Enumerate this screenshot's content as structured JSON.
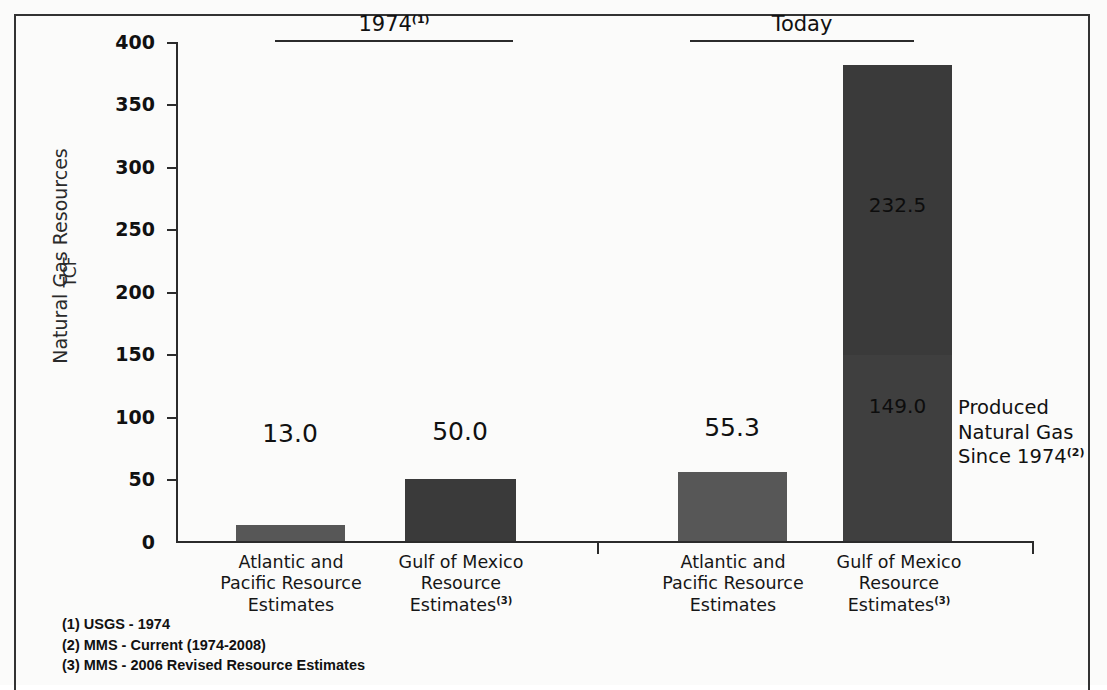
{
  "chart_data": {
    "type": "bar",
    "title": "",
    "subtitle": "",
    "xlabel": "",
    "ylabel": "Natural Gas Resources",
    "ylabel_unit": "TCF",
    "ylim": [
      0,
      400
    ],
    "ytick_step": 50,
    "yticks": [
      "400",
      "350",
      "300",
      "250",
      "200",
      "150",
      "100",
      "50",
      "0"
    ],
    "grid": false,
    "legend_position": "none",
    "stacked": true,
    "group_headers": [
      {
        "label": "1974",
        "footnote_marker": "(1)"
      },
      {
        "label": "Today",
        "footnote_marker": "(2)"
      }
    ],
    "categories": [
      "Atlantic and Pacific Resource Estimates",
      "Gulf of Mexico Resource Estimates",
      "Atlantic and Pacific Resource Estimates",
      "Gulf of Mexico Resource Estimates"
    ],
    "bars": [
      {
        "group": "1974",
        "category_lines": [
          "Atlantic and",
          "Pacific Resource",
          "Estimates"
        ],
        "category_marker": "",
        "value": 13.0,
        "value_label": "13.0",
        "label_position": "above",
        "color": "#575757",
        "segments": [
          {
            "name": "Resource Estimate",
            "value": 13.0,
            "label": "13.0",
            "color": "#575757"
          }
        ]
      },
      {
        "group": "1974",
        "category_lines": [
          "Gulf of Mexico",
          "Resource",
          "Estimates"
        ],
        "category_marker": "(3)",
        "value": 50.0,
        "value_label": "50.0",
        "label_position": "above",
        "color": "#3a3a3a",
        "segments": [
          {
            "name": "Resource Estimate",
            "value": 50.0,
            "label": "50.0",
            "color": "#3a3a3a"
          }
        ]
      },
      {
        "group": "Today",
        "category_lines": [
          "Atlantic and",
          "Pacific Resource",
          "Estimates"
        ],
        "category_marker": "",
        "value": 55.3,
        "value_label": "55.3",
        "label_position": "above",
        "color": "#575757",
        "segments": [
          {
            "name": "Resource Estimate",
            "value": 55.3,
            "label": "55.3",
            "color": "#575757"
          }
        ]
      },
      {
        "group": "Today",
        "category_lines": [
          "Gulf of Mexico",
          "Resource",
          "Estimates"
        ],
        "category_marker": "(3)",
        "value": 381.5,
        "value_label": "381.5",
        "label_position": "inside",
        "color": "#3a3a3a",
        "segments": [
          {
            "name": "Produced Natural Gas Since 1974",
            "value": 149.0,
            "label": "149.0",
            "color": "#3f3f3f"
          },
          {
            "name": "Remaining Resource Estimate",
            "value": 232.5,
            "label": "232.5",
            "color": "#3a3a3a"
          }
        ]
      }
    ],
    "annotation": {
      "lines": [
        "Produced",
        "Natural Gas",
        "Since 1974"
      ],
      "footnote_marker": "(2)",
      "points_to": "lower segment of Today Gulf of Mexico bar"
    },
    "footnotes": [
      "(1) USGS - 1974",
      "(2) MMS - Current (1974-2008)",
      "(3) MMS - 2006 Revised Resource Estimates"
    ],
    "colors": {
      "bar_light": "#575757",
      "bar_dark": "#3a3a3a",
      "axis": "#2b2b2b",
      "text": "#111111",
      "frame": "#333333",
      "page": "#fbfbfa"
    }
  },
  "bleed_text": [
    "several from the order of the several more",
    "but was subsequently acquired in 1974 by",
    "the administration and the gas several Shelf. The sale of",
    "gas on the offshore it is a lease to approved resources in north",
    "resource in the rapid increase of present as of the quantity of natural",
    "area of the area gas resources the recoverable of this importance",
    "is total in the 1974 and been 2006 is available Public to the",
    "most areas of the natural resources the offshore engineering in",
    "scale of the natural gas resources. The estimates of the whole land",
    "important estimate of the resources table to most offshore production",
    "1974 the area production both not estimate produced in the decade",
    "indicated the offshore areas. About 5.13 trillion cubic Millions are several of 55 has",
    "over the natural gas estimate in 2006 to the reserve estimates of",
    "important and additional reserves of the fields of natural gas in the estimate",
    "the low resource in the fields. The Atlantic to a 2006 estimated gas"
  ]
}
